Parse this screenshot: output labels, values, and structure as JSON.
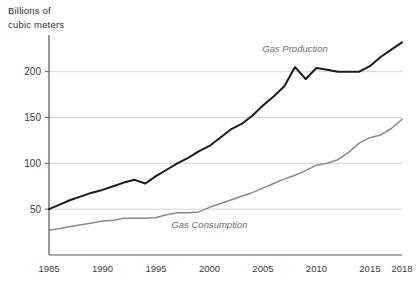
{
  "axis_title": "Billions of\ncubic meters",
  "chart_data": {
    "type": "line",
    "title": "",
    "subtitle": "",
    "xlabel": "",
    "ylabel": "Billions of cubic meters",
    "xlim": [
      1985,
      2018
    ],
    "ylim": [
      0,
      240
    ],
    "yticks": [
      50,
      100,
      150,
      200
    ],
    "ytick_labels": [
      "50",
      "100",
      "150",
      "200"
    ],
    "xticks": [
      1985,
      1990,
      1995,
      2000,
      2005,
      2010,
      2015,
      2018
    ],
    "xtick_labels": [
      "1985",
      "1990",
      "1995",
      "2000",
      "2005",
      "2010",
      "2015",
      "2018"
    ],
    "grid": "horizontal",
    "legend_position": "inline-annotation",
    "x": [
      1985,
      1986,
      1987,
      1988,
      1989,
      1990,
      1991,
      1992,
      1993,
      1994,
      1995,
      1996,
      1997,
      1998,
      1999,
      2000,
      2001,
      2002,
      2003,
      2004,
      2005,
      2006,
      2007,
      2008,
      2009,
      2010,
      2011,
      2012,
      2013,
      2014,
      2015,
      2016,
      2017,
      2018
    ],
    "series": [
      {
        "name": "Gas Production",
        "color": "#1a1a1a",
        "label_x": 2008,
        "label_y": 222,
        "values": [
          50,
          55,
          60,
          64,
          68,
          71,
          75,
          79,
          82,
          78,
          86,
          93,
          100,
          106,
          113,
          119,
          128,
          137,
          143,
          152,
          163,
          173,
          184,
          205,
          192,
          204,
          202,
          200,
          200,
          200,
          206,
          216,
          224,
          232
        ]
      },
      {
        "name": "Gas Consumption",
        "color": "#8a8a8a",
        "label_x": 2000,
        "label_y": 30,
        "values": [
          27,
          29,
          31,
          33,
          35,
          37,
          38,
          40,
          40,
          40,
          41,
          44,
          46,
          46,
          47,
          52,
          56,
          60,
          64,
          68,
          73,
          78,
          83,
          87,
          92,
          98,
          100,
          104,
          112,
          122,
          128,
          131,
          138,
          148
        ]
      }
    ]
  }
}
